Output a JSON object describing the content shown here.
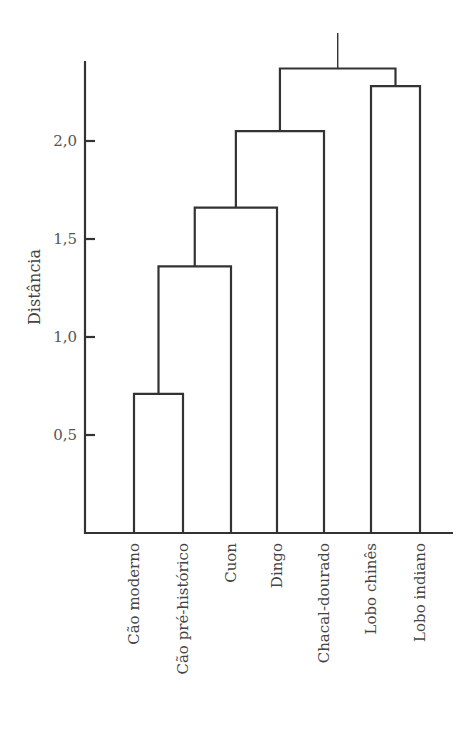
{
  "chart_data": {
    "type": "dendrogram",
    "title": "",
    "xlabel": "",
    "ylabel": "Distância",
    "ylim": [
      0,
      2.45
    ],
    "yticks": [
      {
        "value": 0.5,
        "label": "0,5"
      },
      {
        "value": 1.0,
        "label": "1,0"
      },
      {
        "value": 1.5,
        "label": "1,5"
      },
      {
        "value": 2.0,
        "label": "2,0"
      }
    ],
    "grid": false,
    "leaves": [
      "Cão moderno",
      "Cão pré-histórico",
      "Cuon",
      "Dingo",
      "Chacal-dourado",
      "Lobo chinês",
      "Lobo indiano"
    ],
    "merges": [
      {
        "id": "n1",
        "children": [
          "Cão moderno",
          "Cão pré-histórico"
        ],
        "height": 0.71
      },
      {
        "id": "n2",
        "children": [
          "n1",
          "Cuon"
        ],
        "height": 1.36
      },
      {
        "id": "n3",
        "children": [
          "n2",
          "Dingo"
        ],
        "height": 1.66
      },
      {
        "id": "n4",
        "children": [
          "n3",
          "Chacal-dourado"
        ],
        "height": 2.05
      },
      {
        "id": "n5",
        "children": [
          "Lobo chinês",
          "Lobo indiano"
        ],
        "height": 2.28
      },
      {
        "id": "root",
        "children": [
          "n4",
          "n5"
        ],
        "height": 2.37
      }
    ],
    "line_color": "#333333"
  }
}
